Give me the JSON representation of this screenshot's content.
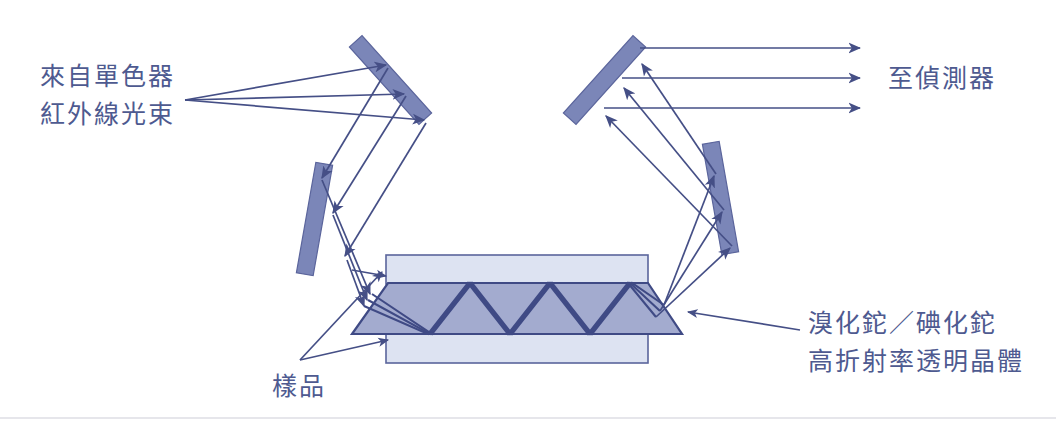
{
  "figure": {
    "kind": "optical-diagram",
    "title_visible": false,
    "background_color": "#ffffff"
  },
  "colors": {
    "ink": "#454f86",
    "ray": "#454f86",
    "mirror_fill": "#7b86b8",
    "mirror_stroke": "#5b659c",
    "crystal_fill": "#a3abcf",
    "crystal_stroke": "#3f4a85",
    "sample_fill": "#dde3f2",
    "sample_stroke": "#5b659c",
    "text": "#4e5a90",
    "page_edge": "#c9c9d4"
  },
  "labels": {
    "source": {
      "name": "ir-beam-source-label",
      "line1": "來自單色器",
      "line2": "紅外線光束"
    },
    "detector": {
      "name": "detector-label",
      "line1": "至偵測器"
    },
    "crystal": {
      "name": "crystal-material-label",
      "line1": "溴化鉈／碘化鉈",
      "line2": "高折射率透明晶體"
    },
    "sample": {
      "name": "sample-label",
      "line1": "樣品"
    }
  },
  "components": {
    "mirror_top_left": {
      "name": "mirror-top-left",
      "type": "plane-mirror"
    },
    "mirror_lower_left": {
      "name": "mirror-lower-left",
      "type": "plane-mirror"
    },
    "mirror_top_right": {
      "name": "mirror-top-right",
      "type": "plane-mirror"
    },
    "mirror_lower_right": {
      "name": "mirror-lower-right",
      "type": "plane-mirror"
    },
    "sample_upper": {
      "name": "sample-layer-upper",
      "type": "sample-film"
    },
    "sample_lower": {
      "name": "sample-layer-lower",
      "type": "sample-film"
    },
    "crystal": {
      "name": "atr-crystal",
      "type": "trapezoid-prism"
    },
    "internal_reflections": {
      "name": "internal-reflection-path",
      "bounces": 8
    },
    "input_rays": {
      "name": "input-ray-bundle",
      "count": 3
    },
    "output_rays": {
      "name": "output-ray-bundle",
      "count": 3
    }
  }
}
